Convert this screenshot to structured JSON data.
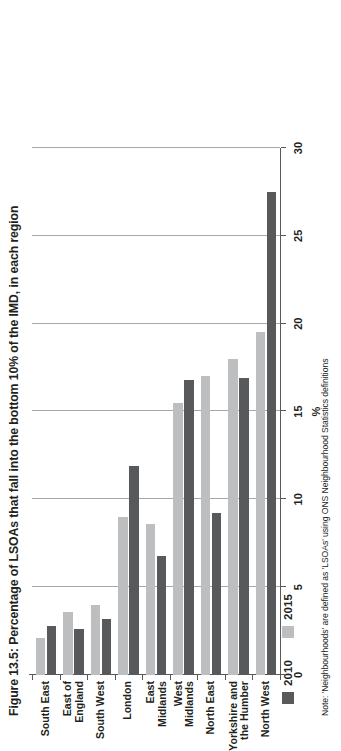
{
  "chart_data": {
    "type": "bar",
    "orientation": "horizontal",
    "title": "Figure 13.5: Percentage of LSOAs that fall into the bottom 10% of the IMD, in each region",
    "xlabel": "%",
    "ylabel": "",
    "xlim": [
      0,
      30
    ],
    "xticks": [
      0,
      5,
      10,
      15,
      20,
      25,
      30
    ],
    "xticklabels": [
      "0",
      "5",
      "10",
      "15",
      "20",
      "25",
      "30"
    ],
    "grid": true,
    "legend_position": "top-left",
    "categories": [
      "North West",
      "Yorkshire and the Humber",
      "North East",
      "West Midlands",
      "East Midlands",
      "London",
      "South West",
      "East of England",
      "South East"
    ],
    "series": [
      {
        "name": "2010",
        "color": "#58595b",
        "values": [
          27.5,
          16.9,
          9.2,
          16.8,
          6.8,
          11.9,
          3.2,
          2.6,
          2.8
        ]
      },
      {
        "name": "2015",
        "color": "#bcbec0",
        "values": [
          19.5,
          18.0,
          17.0,
          15.5,
          8.6,
          9.0,
          4.0,
          3.6,
          2.1
        ]
      }
    ],
    "note": "Note: 'Neighbourhoods' are defined as 'LSOAs' using ONS Neighbourhood Statistics definitions"
  },
  "legend": {
    "items": [
      {
        "label": "2010",
        "color": "#58595b"
      },
      {
        "label": "2015",
        "color": "#bcbec0"
      }
    ]
  },
  "footnote": {
    "text": "Note: 'Neighbourhoods' are defined as 'LSOAs' using ONS Neighbourhood Statistics definitions"
  }
}
